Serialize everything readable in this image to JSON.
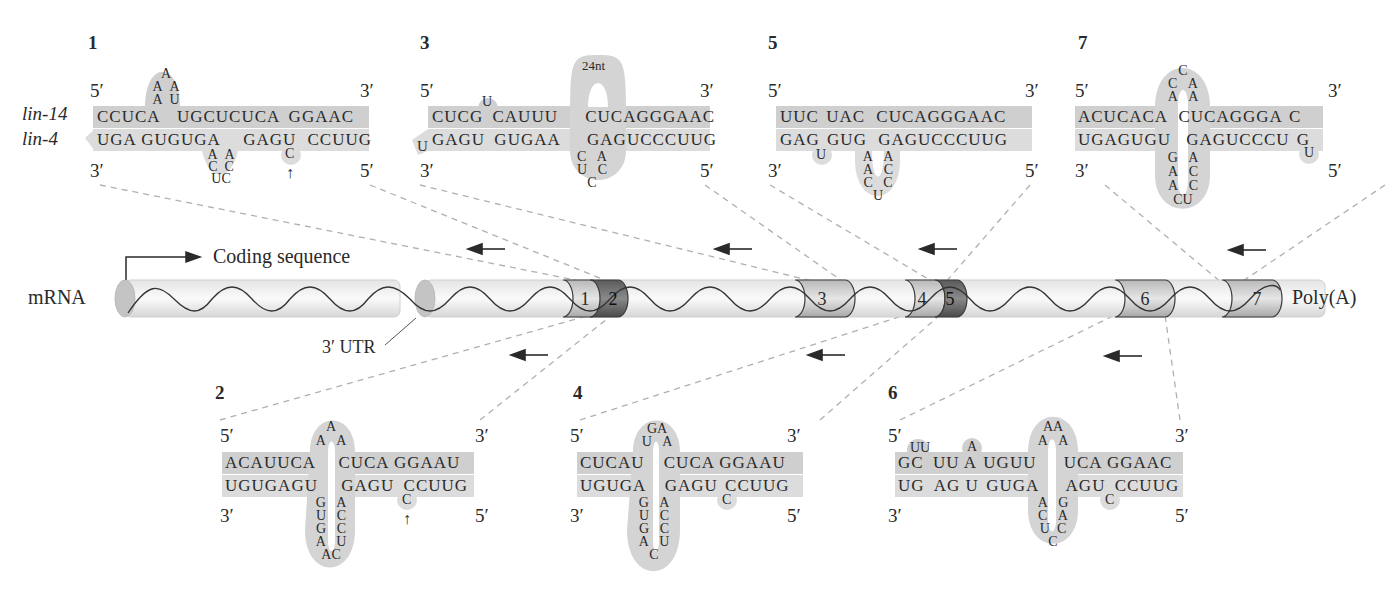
{
  "figure": {
    "strand_labels": {
      "top": "lin-14",
      "bottom": "lin-4"
    },
    "mrna": {
      "label": "mRNA",
      "coding_label": "Coding sequence",
      "utr_label": "3′ UTR",
      "polya_label": "Poly(A)",
      "sites": [
        "1",
        "2",
        "3",
        "4",
        "5",
        "6",
        "7"
      ],
      "colors": {
        "tube": "#e8e8e8",
        "site_light": "#c9c9c9",
        "site_dark": "#6e6e6e",
        "bar": "#d2d2d2"
      }
    },
    "panels": [
      {
        "id": "1",
        "label": "1",
        "end5_top": "5′",
        "end3_top": "3′",
        "end3_bottom": "3′",
        "end5_bottom": "5′",
        "top": [
          "CCUCA",
          "UGCUCUCA",
          "GGAAC"
        ],
        "bottom": [
          "UGA GUGUGA",
          "GAGU",
          "CCUUG"
        ],
        "loop_top": [
          "A",
          "A",
          "A",
          "A",
          "U"
        ],
        "loop_bottom": [
          "A",
          "C",
          "UC",
          "C",
          "A"
        ],
        "bulge": "C",
        "arrow": "↑"
      },
      {
        "id": "2",
        "label": "2",
        "end5_top": "5′",
        "end3_top": "3′",
        "end3_bottom": "3′",
        "end5_bottom": "5′",
        "top": [
          "ACAUUCA",
          "CUCA GGAAU"
        ],
        "bottom": [
          "UGUGAGU",
          "GAGU",
          "CCUUG"
        ],
        "loop_top": [
          "A",
          "A",
          "A"
        ],
        "loop_bottom_left": [
          "G",
          "U",
          "G",
          "A",
          "A"
        ],
        "loop_bottom_right": [
          "A",
          "C",
          "C",
          "U",
          "C"
        ],
        "bulge": "C",
        "arrow": "↑"
      },
      {
        "id": "3",
        "label": "3",
        "end5_top": "5′",
        "end3_top": "3′",
        "end3_bottom": "3′",
        "end5_bottom": "5′",
        "top": [
          "CUCG",
          "CAUUU",
          "CUCAGGGAAC"
        ],
        "bottom": [
          "GAGU",
          "GUGAA",
          "GAGUCCCUUG"
        ],
        "bulge_top": "U",
        "bulge_bottom": "U",
        "loop_label": "24nt",
        "loop_bottom": [
          "C",
          "U",
          "C",
          "C",
          "A"
        ]
      },
      {
        "id": "4",
        "label": "4",
        "end5_top": "5′",
        "end3_top": "3′",
        "end3_bottom": "3′",
        "end5_bottom": "5′",
        "top": [
          "CUCAU",
          "CUCA GGAAU"
        ],
        "bottom": [
          "UGUGA",
          "GAGU",
          "CCUUG"
        ],
        "loop_top": [
          "U",
          "GA",
          "A"
        ],
        "loop_bottom_left": [
          "G",
          "U",
          "G",
          "A"
        ],
        "loop_bottom_right": [
          "A",
          "C",
          "C",
          "U"
        ],
        "loop_bottom_mid": "C",
        "bulge": "C"
      },
      {
        "id": "5",
        "label": "5",
        "end5_top": "5′",
        "end3_top": "3′",
        "end3_bottom": "3′",
        "end5_bottom": "5′",
        "top": [
          "UUC",
          "UAC",
          "CUCAGGGAAC"
        ],
        "bottom": [
          "GAG",
          "GUG",
          "GAGUCCCUUG"
        ],
        "bulge": "U",
        "loop_bottom_left": [
          "A",
          "A",
          "C"
        ],
        "loop_bottom_right": [
          "A",
          "C",
          "C"
        ],
        "loop_bottom_mid": "U"
      },
      {
        "id": "6",
        "label": "6",
        "end5_top": "5′",
        "end3_top": "3′",
        "end3_bottom": "3′",
        "end5_bottom": "5′",
        "top": [
          "GC",
          "UU A",
          "UGUU",
          "UCA GGAAC"
        ],
        "bottom": [
          "UG",
          "AG U",
          "GUGA",
          "AGU",
          "CCUUG"
        ],
        "bulge_top_1": "UU",
        "bulge_top_2": "A",
        "loop_top": [
          "A",
          "AA",
          "A"
        ],
        "loop_bottom_left": [
          "A",
          "C",
          "U"
        ],
        "loop_bottom_right": [
          "G",
          "A",
          "C"
        ],
        "loop_bottom_mid": "C",
        "bulge": "C"
      },
      {
        "id": "7",
        "label": "7",
        "end5_top": "5′",
        "end3_top": "3′",
        "end3_bottom": "3′",
        "end5_bottom": "5′",
        "top": [
          "ACUCACA",
          "CUCAGGGA",
          "C"
        ],
        "bottom": [
          "UGAGUGU",
          "GAGUCCCU",
          "G"
        ],
        "loop_top": [
          "A",
          "C",
          "C",
          "A",
          "A"
        ],
        "loop_bottom_left": [
          "G",
          "A",
          "A"
        ],
        "loop_bottom_right": [
          "A",
          "C",
          "C"
        ],
        "loop_bottom_mid": "CU",
        "bulge": "U"
      }
    ]
  }
}
